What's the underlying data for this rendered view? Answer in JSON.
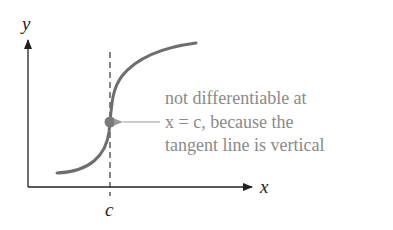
{
  "diagram": {
    "axes": {
      "x_label": "x",
      "y_label": "y"
    },
    "tick_label": "c",
    "annotation": {
      "lines": [
        "not differentiable at",
        "x = c, because the",
        "tangent line is vertical"
      ]
    },
    "colors": {
      "axis": "#222222",
      "curve": "#6e6e6e",
      "point": "#7a7a7a",
      "annotation_text": "#8a8a8a",
      "dashed_line": "#333333"
    }
  }
}
